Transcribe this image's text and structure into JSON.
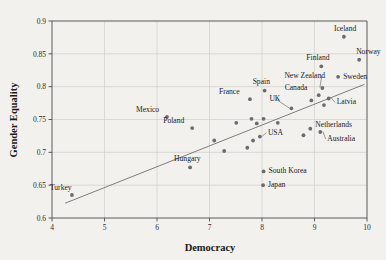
{
  "chart_data": {
    "type": "scatter",
    "title": "",
    "xlabel": "Democracy",
    "ylabel": "Gender Equality",
    "xlim": [
      4,
      10
    ],
    "ylim": [
      0.6,
      0.9
    ],
    "xticks": [
      "4",
      "5",
      "6",
      "7",
      "8",
      "9",
      "10"
    ],
    "yticks": [
      "0.6",
      "0.65",
      "0.7",
      "0.75",
      "0.8",
      "0.85",
      "0.9"
    ],
    "grid": true,
    "legend": "none",
    "marker_color": "#6b6b70",
    "trend_line": {
      "visible": true,
      "x_start": 4.25,
      "y_start": 0.6225,
      "x_end": 9.95,
      "y_end": 0.8035,
      "color": "#6f6f6f"
    },
    "points": [
      {
        "label": "Turkey",
        "x": 4.38,
        "y": 0.635,
        "label_dx": -22,
        "label_dy": -5,
        "anchor": "start",
        "leader": false
      },
      {
        "label": "Mexico",
        "x": 6.19,
        "y": 0.754,
        "label_dx": -31,
        "label_dy": -5,
        "anchor": "start",
        "leader": false
      },
      {
        "label": "Poland",
        "x": 6.67,
        "y": 0.737,
        "label_dx": -29,
        "label_dy": -5,
        "anchor": "start",
        "leader": false
      },
      {
        "label": "Hungary",
        "x": 6.63,
        "y": 0.677,
        "label_dx": -16,
        "label_dy": -6,
        "anchor": "start",
        "leader": false
      },
      {
        "label": "France",
        "x": 7.77,
        "y": 0.781,
        "label_dx": -31,
        "label_dy": -5,
        "anchor": "start",
        "leader": false
      },
      {
        "label": "Spain",
        "x": 8.05,
        "y": 0.794,
        "label_dx": -12,
        "label_dy": -7,
        "anchor": "start",
        "leader": false
      },
      {
        "label": "UK",
        "x": 8.56,
        "y": 0.767,
        "label_dx": -22,
        "label_dy": -7,
        "anchor": "start",
        "leader": true
      },
      {
        "label": "USA",
        "x": 7.96,
        "y": 0.724,
        "label_dx": 8,
        "label_dy": -2,
        "anchor": "start",
        "leader": true
      },
      {
        "label": "Canada",
        "x": 9.08,
        "y": 0.787,
        "label_dx": -34,
        "label_dy": -5,
        "anchor": "start",
        "leader": false
      },
      {
        "label": "New Zealand",
        "x": 9.15,
        "y": 0.798,
        "label_dx": -38,
        "label_dy": -10,
        "anchor": "start",
        "leader": true
      },
      {
        "label": "Sweden",
        "x": 9.45,
        "y": 0.815,
        "label_dx": 5,
        "label_dy": 2,
        "anchor": "start",
        "leader": false
      },
      {
        "label": "Finland",
        "x": 9.13,
        "y": 0.831,
        "label_dx": -15,
        "label_dy": -6,
        "anchor": "start",
        "leader": false
      },
      {
        "label": "Norway",
        "x": 9.85,
        "y": 0.841,
        "label_dx": -3,
        "label_dy": -6,
        "anchor": "start",
        "leader": false
      },
      {
        "label": "Iceland",
        "x": 9.56,
        "y": 0.876,
        "label_dx": -10,
        "label_dy": -6,
        "anchor": "start",
        "leader": false
      },
      {
        "label": "Latvia",
        "x": 9.27,
        "y": 0.782,
        "label_dx": 8,
        "label_dy": 6,
        "anchor": "start",
        "leader": true
      },
      {
        "label": "Netherlands",
        "x": 8.92,
        "y": 0.736,
        "label_dx": 5,
        "label_dy": -2,
        "anchor": "start",
        "leader": false
      },
      {
        "label": "Australia",
        "x": 9.11,
        "y": 0.731,
        "label_dx": 7,
        "label_dy": 9,
        "anchor": "start",
        "leader": true
      },
      {
        "label": "South Korea",
        "x": 8.03,
        "y": 0.671,
        "label_dx": 5,
        "label_dy": 2,
        "anchor": "start",
        "leader": false
      },
      {
        "label": "Japan",
        "x": 8.02,
        "y": 0.65,
        "label_dx": 5,
        "label_dy": 2,
        "anchor": "start",
        "leader": false
      },
      {
        "label": "",
        "x": 7.09,
        "y": 0.718,
        "label_dx": 0,
        "label_dy": 0,
        "anchor": "start",
        "leader": false
      },
      {
        "label": "",
        "x": 7.28,
        "y": 0.702,
        "label_dx": 0,
        "label_dy": 0,
        "anchor": "start",
        "leader": false
      },
      {
        "label": "",
        "x": 7.51,
        "y": 0.745,
        "label_dx": 0,
        "label_dy": 0,
        "anchor": "start",
        "leader": false
      },
      {
        "label": "",
        "x": 7.72,
        "y": 0.707,
        "label_dx": 0,
        "label_dy": 0,
        "anchor": "start",
        "leader": false
      },
      {
        "label": "",
        "x": 7.8,
        "y": 0.751,
        "label_dx": 0,
        "label_dy": 0,
        "anchor": "start",
        "leader": false
      },
      {
        "label": "",
        "x": 7.83,
        "y": 0.718,
        "label_dx": 0,
        "label_dy": 0,
        "anchor": "start",
        "leader": false
      },
      {
        "label": "",
        "x": 7.9,
        "y": 0.744,
        "label_dx": 0,
        "label_dy": 0,
        "anchor": "start",
        "leader": false
      },
      {
        "label": "",
        "x": 8.03,
        "y": 0.751,
        "label_dx": 0,
        "label_dy": 0,
        "anchor": "start",
        "leader": false
      },
      {
        "label": "",
        "x": 8.3,
        "y": 0.745,
        "label_dx": 0,
        "label_dy": 0,
        "anchor": "start",
        "leader": false
      },
      {
        "label": "",
        "x": 8.79,
        "y": 0.726,
        "label_dx": 0,
        "label_dy": 0,
        "anchor": "start",
        "leader": false
      },
      {
        "label": "",
        "x": 8.94,
        "y": 0.779,
        "label_dx": 0,
        "label_dy": 0,
        "anchor": "start",
        "leader": false
      },
      {
        "label": "",
        "x": 9.18,
        "y": 0.772,
        "label_dx": 0,
        "label_dy": 0,
        "anchor": "start",
        "leader": false
      }
    ]
  }
}
